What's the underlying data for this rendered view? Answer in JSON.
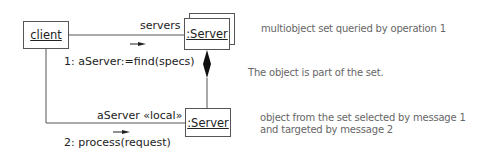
{
  "diagram": {
    "type": "UML collaboration diagram",
    "objects": {
      "client": {
        "label": "client"
      },
      "server_multi": {
        "label": ":Server",
        "kind": "multiobject"
      },
      "server_local": {
        "label": ":Server"
      }
    },
    "links": {
      "servers_role": "servers",
      "local_role": "aServer «local»"
    },
    "messages": {
      "msg1": "1: aServer:=find(specs)",
      "msg2": "2: process(request)"
    },
    "notes": {
      "multiobject": "multiobject set queried by operation 1",
      "composition": "The object is part of the set.",
      "selected_line1": "object from the set selected by message 1",
      "selected_line2": "and targeted by message 2"
    },
    "colors": {
      "line": "#555555",
      "text": "#222222",
      "note_text": "#666666"
    }
  }
}
